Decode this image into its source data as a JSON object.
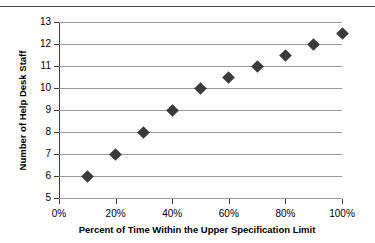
{
  "chart_data": {
    "type": "scatter",
    "title": "",
    "subtitle": "",
    "xlabel": "Percent of Time Within the Upper Specification Limit",
    "ylabel": "Number of Help Desk Staff",
    "x": [
      10,
      20,
      30,
      40,
      50,
      60,
      70,
      80,
      90,
      100
    ],
    "values": [
      6,
      7,
      8,
      9,
      10,
      10.5,
      11,
      11.5,
      12,
      12.5
    ],
    "series": [
      {
        "name": "Help Desk Staff",
        "values": [
          6,
          7,
          8,
          9,
          10,
          10.5,
          11,
          11.5,
          12,
          12.5
        ]
      }
    ],
    "xlim": [
      0,
      100
    ],
    "ylim": [
      5,
      13
    ],
    "xtick_labels": [
      "0%",
      "20%",
      "40%",
      "60%",
      "80%",
      "100%"
    ],
    "xtick_values": [
      0,
      20,
      40,
      60,
      80,
      100
    ],
    "ytick_labels": [
      "5",
      "6",
      "7",
      "8",
      "9",
      "10",
      "11",
      "12",
      "13"
    ],
    "ytick_values": [
      5,
      6,
      7,
      8,
      9,
      10,
      11,
      12,
      13
    ],
    "grid": "horizontal",
    "legend": "none",
    "marker": "diamond",
    "marker_color": "#3b3b3b",
    "gridline_color": "#9a9a9a",
    "axis_color": "#3a3a3a",
    "background_color": "#ffffff"
  },
  "figure": {
    "y_axis_title": "Number of Help Desk Staff",
    "x_axis_title": "Percent of Time Within the Upper Specification Limit"
  }
}
